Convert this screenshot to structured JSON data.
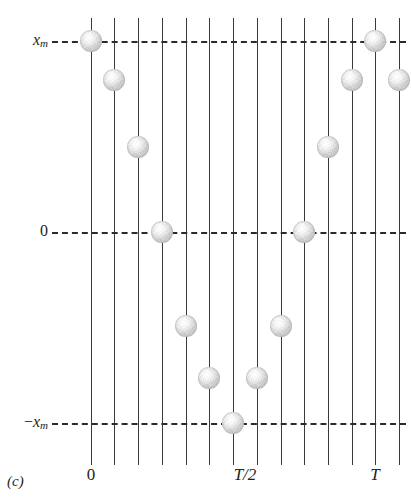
{
  "caption": "(c)",
  "axes": {
    "y_labels": [
      {
        "name": "y-label-xm",
        "main": "x",
        "sub": "m",
        "prefix": "",
        "y": 41
      },
      {
        "name": "y-label-zero",
        "main": "0",
        "sub": "",
        "prefix": "",
        "y": 232
      },
      {
        "name": "y-label-neg-xm",
        "main": "x",
        "sub": "m",
        "prefix": "−",
        "y": 423
      }
    ],
    "x_labels": [
      {
        "name": "x-label-zero",
        "text": "0",
        "x": 91,
        "italic": false
      },
      {
        "name": "x-label-half-T",
        "text": "T/2",
        "x": 245,
        "italic": true
      },
      {
        "name": "x-label-T",
        "text": "T",
        "x": 375,
        "italic": true
      }
    ],
    "line_color": "#3a3a3a",
    "dash_color": "#2b2b2b"
  },
  "chart_data": {
    "type": "scatter",
    "title": "",
    "subtitle": "",
    "xlabel": "",
    "ylabel": "",
    "grid": "vertical lines at each sample time; dashed horizontal reference lines at x_m, 0 and -x_m",
    "legend": "none",
    "x_tick_labels": [
      "0",
      "T/2",
      "T"
    ],
    "y_tick_labels": [
      "x_m",
      "0",
      "-x_m"
    ],
    "ylim": [
      "-x_m",
      "x_m"
    ],
    "xlim": [
      "0",
      "T + T/13"
    ],
    "sample_count": 14,
    "x": [
      "0",
      "T/12",
      "2T/12",
      "3T/12",
      "4T/12",
      "5T/12",
      "6T/12",
      "7T/12",
      "8T/12",
      "9T/12",
      "10T/12",
      "11T/12",
      "T",
      "13T/12"
    ],
    "values": [
      1.0,
      0.79,
      0.5,
      0.0,
      -0.5,
      -0.79,
      -1.0,
      -0.79,
      -0.5,
      0.0,
      0.5,
      0.79,
      1.0,
      0.79
    ],
    "points": [
      {
        "name": "ball-1",
        "x": 91,
        "y": 41,
        "t_index": 0,
        "value": 1.0
      },
      {
        "name": "ball-2",
        "x": 114,
        "y": 80,
        "t_index": 1,
        "value": 0.79
      },
      {
        "name": "ball-3",
        "x": 138,
        "y": 147,
        "t_index": 2,
        "value": 0.5
      },
      {
        "name": "ball-4",
        "x": 162,
        "y": 232,
        "t_index": 3,
        "value": 0.0
      },
      {
        "name": "ball-5",
        "x": 186,
        "y": 326,
        "t_index": 4,
        "value": -0.5
      },
      {
        "name": "ball-6",
        "x": 209,
        "y": 378,
        "t_index": 5,
        "value": -0.79
      },
      {
        "name": "ball-7",
        "x": 233,
        "y": 423,
        "t_index": 6,
        "value": -1.0
      },
      {
        "name": "ball-8",
        "x": 257,
        "y": 378,
        "t_index": 7,
        "value": -0.79
      },
      {
        "name": "ball-9",
        "x": 281,
        "y": 326,
        "t_index": 8,
        "value": -0.5
      },
      {
        "name": "ball-10",
        "x": 304,
        "y": 232,
        "t_index": 9,
        "value": 0.0
      },
      {
        "name": "ball-11",
        "x": 328,
        "y": 147,
        "t_index": 10,
        "value": 0.5
      },
      {
        "name": "ball-12",
        "x": 352,
        "y": 80,
        "t_index": 11,
        "value": 0.79
      },
      {
        "name": "ball-13",
        "x": 375,
        "y": 41,
        "t_index": 12,
        "value": 1.0
      },
      {
        "name": "ball-14",
        "x": 399,
        "y": 80,
        "t_index": 13,
        "value": 0.79
      }
    ],
    "time_lines_x": [
      91,
      114,
      138,
      162,
      186,
      209,
      233,
      257,
      281,
      304,
      328,
      352,
      375,
      399
    ],
    "reference_lines_y": [
      41,
      232,
      423
    ]
  }
}
